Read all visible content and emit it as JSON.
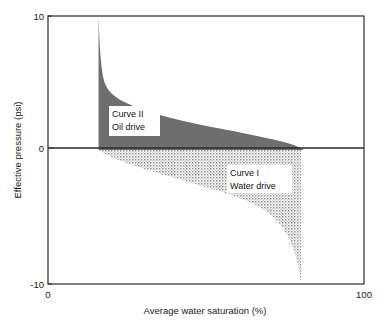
{
  "figure": {
    "background_color": "#ffffff",
    "frame_color": "#3b3b3b"
  },
  "chart_data": {
    "type": "area",
    "title": "",
    "subtitle": "",
    "xlabel": "Average water saturation (%)",
    "ylabel": "Effective pressure (psi)",
    "xlim": [
      0,
      100
    ],
    "ylim": [
      -10,
      10
    ],
    "xticks": [
      0,
      100
    ],
    "xticklabels": [
      "0",
      "100"
    ],
    "yticks": [
      -10,
      0,
      10
    ],
    "yticklabels": [
      "-10",
      "0",
      "10"
    ],
    "grid": false,
    "legend": "inline-annotations",
    "zero_reference_line": 0,
    "annotations": [
      {
        "name": "curve-ii-label",
        "line1": "Curve II",
        "line2": "Oil drive",
        "x": 35,
        "y": 3.0
      },
      {
        "name": "curve-i-label",
        "line1": "Curve I",
        "line2": "Water drive",
        "x": 73,
        "y": -2.2
      }
    ],
    "series": [
      {
        "name": "Curve II",
        "label": "Curve II — Oil drive",
        "fill_style": "solid-dark-gray",
        "fill_color": "#6e6e6e",
        "region": "above-zero",
        "x": [
          16.0,
          16.2,
          16.5,
          16.9,
          17.3,
          17.8,
          18.4,
          19.2,
          20.2,
          21.5,
          23.0,
          25.0,
          27.5,
          30.5,
          34.0,
          38.0,
          42.5,
          47.5,
          53.0,
          58.5,
          63.5,
          68.0,
          72.0,
          75.5,
          78.0,
          79.8,
          81.0
        ],
        "y": [
          10.0,
          8.6,
          7.3,
          6.3,
          5.6,
          5.1,
          4.75,
          4.45,
          4.2,
          3.95,
          3.72,
          3.48,
          3.22,
          2.96,
          2.7,
          2.44,
          2.18,
          1.92,
          1.66,
          1.42,
          1.18,
          0.96,
          0.75,
          0.54,
          0.35,
          0.16,
          0.0
        ],
        "baseline": 0
      },
      {
        "name": "Curve I",
        "label": "Curve I — Water drive",
        "fill_style": "dotted-light-gray",
        "fill_color": "#b9b9b9",
        "region": "below-zero",
        "x": [
          16.0,
          18.0,
          21.0,
          25.0,
          30.0,
          35.0,
          40.0,
          45.0,
          50.0,
          55.0,
          60.0,
          65.0,
          69.0,
          72.0,
          74.5,
          76.5,
          78.0,
          79.0,
          79.7,
          80.1
        ],
        "y": [
          0.0,
          -0.3,
          -0.62,
          -0.98,
          -1.38,
          -1.74,
          -2.08,
          -2.42,
          -2.76,
          -3.12,
          -3.52,
          -4.02,
          -4.55,
          -5.15,
          -5.85,
          -6.7,
          -7.55,
          -8.45,
          -9.35,
          -10.0
        ],
        "right_edge_x": 80.1,
        "baseline": 0
      }
    ]
  },
  "axes": {
    "y_tick_top": "10",
    "y_tick_mid": "0",
    "y_tick_bottom": "-10",
    "x_tick_left": "0",
    "x_tick_right": "100",
    "y_axis_title": "Effective pressure (psi)",
    "x_axis_title": "Average water saturation (%)"
  }
}
